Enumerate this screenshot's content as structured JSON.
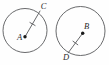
{
  "figure": {
    "width": 109,
    "height": 65,
    "background_color": "#fefefe",
    "stroke_color": "#58595b",
    "dot_color": "#1a1a1a",
    "label_color": "#2b2b2b",
    "stroke_width": 0.9,
    "tick_stroke_width": 0.9
  },
  "circles": [
    {
      "name": "left-circle",
      "center_label": "A",
      "center": {
        "x": 25.0,
        "y": 30.5
      },
      "radius": 22.0,
      "center_dot": {
        "x": 25.0,
        "y": 36.8,
        "r": 1.7
      },
      "center_label_pos": {
        "x": 19.5,
        "y": 38.5
      },
      "radius_endpoint_label": "C",
      "radius_endpoint": {
        "x": 40.0,
        "y": 11.0
      },
      "radius_endpoint_label_pos": {
        "x": 43.5,
        "y": 7.0
      },
      "tick_center": {
        "x": 32.5,
        "y": 24.0
      },
      "tick_half_length": 3.0
    },
    {
      "name": "right-circle",
      "center_label": "B",
      "center": {
        "x": 80.5,
        "y": 31.0
      },
      "radius": 24.5,
      "center_dot": {
        "x": 82.7,
        "y": 33.2,
        "r": 1.7
      },
      "center_label_pos": {
        "x": 86.5,
        "y": 27.0
      },
      "radius_endpoint_label": "D",
      "radius_endpoint": {
        "x": 68.2,
        "y": 52.8
      },
      "radius_endpoint_label_pos": {
        "x": 66.0,
        "y": 58.5
      },
      "tick_center": {
        "x": 75.4,
        "y": 43.0
      },
      "tick_half_length": 3.0
    }
  ]
}
